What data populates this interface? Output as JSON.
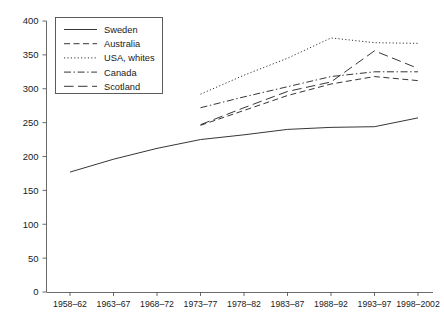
{
  "chart_data": {
    "type": "line",
    "title": "",
    "xlabel": "",
    "ylabel": "",
    "ylim": [
      0,
      400
    ],
    "ytick_step": 50,
    "grid": false,
    "legend_position": "top-left",
    "categories": [
      "1958–62",
      "1963–67",
      "1968–72",
      "1973–77",
      "1978–82",
      "1983–87",
      "1988–92",
      "1993–97",
      "1998–2002"
    ],
    "yticks": [
      "0",
      "50",
      "100",
      "150",
      "200",
      "250",
      "300",
      "350",
      "400"
    ],
    "series": [
      {
        "name": "Sweden",
        "style": "solid",
        "x": [
          "1958–62",
          "1963–67",
          "1968–72",
          "1973–77",
          "1978–82",
          "1983–87",
          "1988–92",
          "1993–97",
          "1998–2002"
        ],
        "values": [
          177,
          196,
          212,
          225,
          232,
          240,
          243,
          244,
          257
        ]
      },
      {
        "name": "Australia",
        "style": "dashed",
        "x": [
          "1973–77",
          "1978–82",
          "1983–87",
          "1988–92",
          "1993–97",
          "1998–2002"
        ],
        "values": [
          246,
          268,
          290,
          307,
          318,
          312
        ]
      },
      {
        "name": "USA, whites",
        "style": "dotted",
        "x": [
          "1973–77",
          "1978–82",
          "1983–87",
          "1988–92",
          "1993–97",
          "1998–2002"
        ],
        "values": [
          292,
          320,
          345,
          375,
          368,
          367
        ]
      },
      {
        "name": "Canada",
        "style": "dashdot",
        "x": [
          "1973–77",
          "1978–82",
          "1983–87",
          "1988–92",
          "1993–97",
          "1998–2002"
        ],
        "values": [
          272,
          288,
          303,
          318,
          325,
          325
        ]
      },
      {
        "name": "Scotland",
        "style": "longdash",
        "x": [
          "1973–77",
          "1978–82",
          "1983–87",
          "1988–92",
          "1993–97",
          "1998–2002"
        ],
        "values": [
          247,
          272,
          296,
          310,
          356,
          330
        ]
      }
    ]
  },
  "legend": {
    "entries": [
      {
        "label": "Sweden"
      },
      {
        "label": "Australia"
      },
      {
        "label": "USA, whites"
      },
      {
        "label": "Canada"
      },
      {
        "label": "Scotland"
      }
    ]
  }
}
